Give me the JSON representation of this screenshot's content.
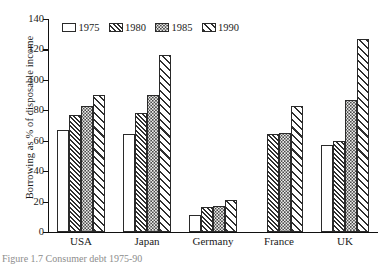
{
  "chart_data": {
    "type": "bar",
    "title": "",
    "xlabel": "",
    "ylabel": "Borrowing as % of disposable income",
    "ylim": [
      0,
      140
    ],
    "yticks": [
      0,
      20,
      40,
      60,
      80,
      100,
      120,
      140
    ],
    "grid": false,
    "legend_position": "top-left-inside",
    "categories": [
      "USA",
      "Japan",
      "Germany",
      "France",
      "UK"
    ],
    "series": [
      {
        "name": "1975",
        "values": [
          67,
          64,
          11,
          null,
          57
        ]
      },
      {
        "name": "1980",
        "values": [
          77,
          78,
          16,
          64,
          60
        ]
      },
      {
        "name": "1985",
        "values": [
          83,
          90,
          17,
          65,
          87
        ]
      },
      {
        "name": "1990",
        "values": [
          90,
          116,
          21,
          83,
          127
        ]
      }
    ]
  },
  "axis": {
    "y_title": "Borrowing as % of disposable income",
    "y_ticks": [
      "0",
      "20",
      "40",
      "60",
      "80",
      "100",
      "120",
      "140"
    ],
    "x_categories": [
      "USA",
      "Japan",
      "Germany",
      "France",
      "UK"
    ]
  },
  "legend": {
    "entries": [
      {
        "label": "1975",
        "pattern": "empty-white"
      },
      {
        "label": "1980",
        "pattern": "dense-diagonal-hatch"
      },
      {
        "label": "1985",
        "pattern": "dotted-stipple"
      },
      {
        "label": "1990",
        "pattern": "wide-diagonal-hatch"
      }
    ]
  },
  "caption": {
    "text": "Figure 1.7   Consumer debt 1975-90"
  },
  "colors": {
    "ink": "#111111",
    "hatch": "#2f2f2f",
    "stipple_fill": "#f0f0ee"
  }
}
